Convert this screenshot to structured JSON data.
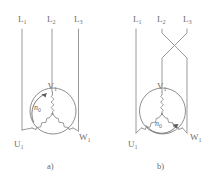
{
  "figure": {
    "background_color": "#ffffff",
    "line_color": "#9a9a9a",
    "text_color": "#6f6f6f",
    "width": 216,
    "height": 180
  },
  "panels": [
    {
      "id": "a",
      "caption": "a)",
      "supply_lines": [
        {
          "name": "L1",
          "base": "L",
          "sub": "1"
        },
        {
          "name": "L2",
          "base": "L",
          "sub": "2"
        },
        {
          "name": "L3",
          "base": "L",
          "sub": "3"
        }
      ],
      "crossed": false,
      "motor_terminals": [
        {
          "name": "U1",
          "base": "U",
          "sub": "1"
        },
        {
          "name": "V1",
          "base": "V",
          "sub": "1"
        },
        {
          "name": "W1",
          "base": "W",
          "sub": "1"
        }
      ],
      "rotation": {
        "label_base": "n",
        "label_sub": "0",
        "direction": "counterclockwise",
        "arrow_position": "upper-left"
      },
      "winding": "star"
    },
    {
      "id": "b",
      "caption": "b)",
      "supply_lines": [
        {
          "name": "L1",
          "base": "L",
          "sub": "1"
        },
        {
          "name": "L2",
          "base": "L",
          "sub": "2"
        },
        {
          "name": "L3",
          "base": "L",
          "sub": "3"
        }
      ],
      "crossed": true,
      "crossed_pair": [
        "L2",
        "L3"
      ],
      "motor_terminals": [
        {
          "name": "U1",
          "base": "U",
          "sub": "1"
        },
        {
          "name": "V1",
          "base": "V",
          "sub": "1"
        },
        {
          "name": "W1",
          "base": "W",
          "sub": "1"
        }
      ],
      "rotation": {
        "label_base": "n",
        "label_sub": "0",
        "direction": "clockwise",
        "arrow_position": "bottom"
      },
      "winding": "star"
    }
  ]
}
